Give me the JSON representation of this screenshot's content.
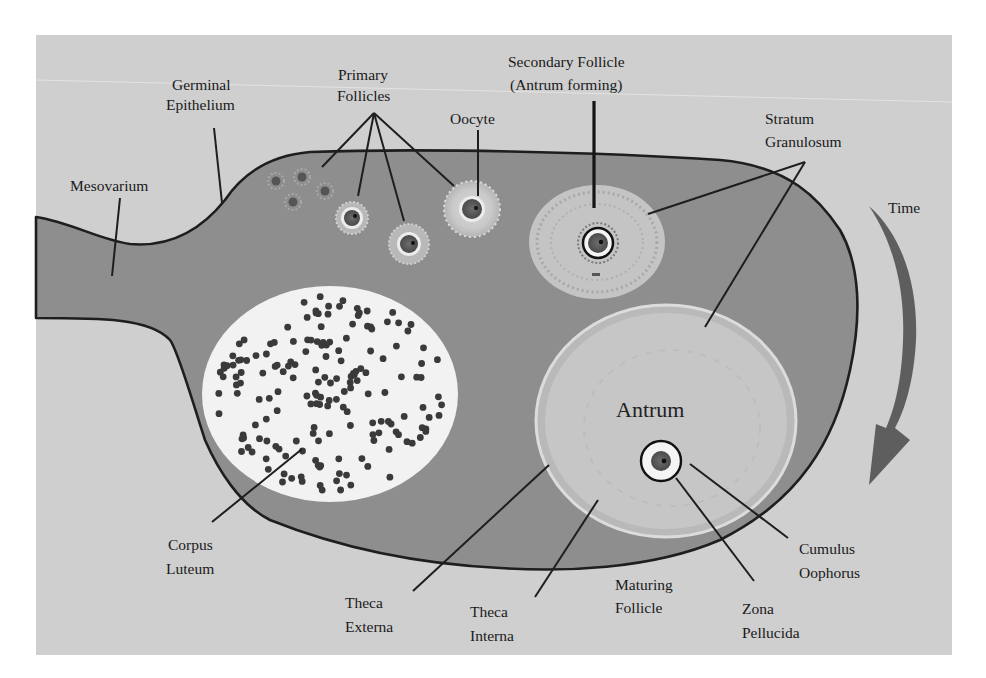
{
  "figure": {
    "colors": {
      "panel_background": "#cfcfcf",
      "ovary_tissue": "#8e8e8e",
      "outline": "#1e1e1e",
      "corpus_luteum_fill": "#f2f2f2",
      "corpus_luteum_dots": "#3a3a3a",
      "follicle_fluid": "#c6c6c6",
      "time_arrow": "#5e5e5e"
    },
    "labels": {
      "mesovarium": "Mesovarium",
      "germinal_epithelium": [
        "Germinal",
        "Epithelium"
      ],
      "primary_follicles": [
        "Primary",
        "Follicles"
      ],
      "oocyte": "Oocyte",
      "secondary_follicle": [
        "Secondary Follicle",
        "(Antrum forming)"
      ],
      "stratum_granulosum": [
        "Stratum",
        "Granulosum"
      ],
      "time": "Time",
      "antrum": "Antrum",
      "corpus_luteum": [
        "Corpus",
        "Luteum"
      ],
      "theca_externa": [
        "Theca",
        "Externa"
      ],
      "theca_interna": [
        "Theca",
        "Interna"
      ],
      "maturing_follicle": [
        "Maturing",
        "Follicle"
      ],
      "zona_pellucida": [
        "Zona",
        "Pellucida"
      ],
      "cumulus_oophorus": [
        "Cumulus",
        "Oophorus"
      ]
    }
  }
}
